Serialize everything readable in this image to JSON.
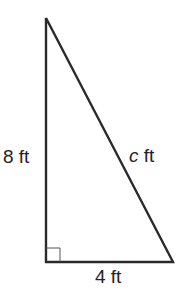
{
  "diagram": {
    "type": "right-triangle",
    "colors": {
      "stroke": "#2a2a2a",
      "text": "#222222",
      "background": "#ffffff"
    },
    "vertices": {
      "top": [
        46,
        18
      ],
      "right_angle": [
        46,
        262
      ],
      "bottom_right": [
        173,
        262
      ]
    },
    "labels": {
      "vertical_leg": "8 ft",
      "hypotenuse_var": "c",
      "hypotenuse_unit": " ft",
      "horizontal_leg": "4 ft"
    },
    "right_angle_marker": true
  }
}
